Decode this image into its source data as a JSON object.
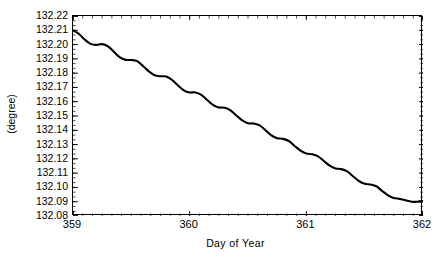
{
  "figure": {
    "title_remnant": "",
    "background_color": "#ffffff",
    "line_color": "#000000",
    "axis_color": "#000000"
  },
  "chart_data": {
    "type": "line",
    "title": "",
    "xlabel": "Day of Year",
    "ylabel": "(degree)",
    "xlim": [
      359,
      362
    ],
    "ylim": [
      132.08,
      132.22
    ],
    "grid": false,
    "legend": null,
    "xticks": [
      359,
      360,
      361,
      362
    ],
    "xtick_labels": [
      "359",
      "360",
      "361",
      "362"
    ],
    "yticks": [
      132.08,
      132.09,
      132.1,
      132.11,
      132.12,
      132.13,
      132.14,
      132.15,
      132.16,
      132.17,
      132.18,
      132.19,
      132.2,
      132.21,
      132.22
    ],
    "ytick_labels": [
      "132.22",
      "132.21",
      "132.20",
      "132.19",
      "132.18",
      "132.17",
      "132.16",
      "132.15",
      "132.14",
      "132.13",
      "132.12",
      "132.11",
      "132.10",
      "132.09",
      "132.08"
    ],
    "x_minor_tick_count": 12,
    "y_minor_tick_count": 2,
    "series": [
      {
        "name": "degree",
        "description": "Linearly decreasing trend from 132.210 to 132.090 with a superimposed ~0.25 day (6 hour) period oscillation of about 0.004 degree amplitude",
        "trend_start": 132.21,
        "trend_end": 132.0905,
        "oscillation_period_days": 0.25,
        "oscillation_amplitude": 0.0042,
        "x": [
          359.0,
          359.05,
          359.1,
          359.15,
          359.2,
          359.25,
          359.3,
          359.35,
          359.4,
          359.45,
          359.5,
          359.55,
          359.6,
          359.65,
          359.7,
          359.75,
          359.8,
          359.85,
          359.9,
          359.95,
          360.0,
          360.05,
          360.1,
          360.15,
          360.2,
          360.25,
          360.3,
          360.35,
          360.4,
          360.45,
          360.5,
          360.55,
          360.6,
          360.65,
          360.7,
          360.75,
          360.8,
          360.85,
          360.9,
          360.95,
          361.0,
          361.05,
          361.1,
          361.15,
          361.2,
          361.25,
          361.3,
          361.35,
          361.4,
          361.45,
          361.5,
          361.55,
          361.6,
          361.65,
          361.7,
          361.75,
          361.8,
          361.85,
          361.9,
          361.95,
          362.0
        ],
        "y": [
          132.21,
          132.2075,
          132.2035,
          132.2005,
          132.1998,
          132.2003,
          132.1988,
          132.195,
          132.1912,
          132.1893,
          132.1892,
          132.1884,
          132.185,
          132.1812,
          132.1785,
          132.1778,
          132.1777,
          132.1752,
          132.1714,
          132.168,
          132.1665,
          132.1665,
          132.1648,
          132.1612,
          132.1578,
          132.156,
          132.1558,
          132.154,
          132.1504,
          132.147,
          132.145,
          132.1447,
          132.1435,
          132.14,
          132.1365,
          132.1345,
          132.134,
          132.1325,
          132.129,
          132.1258,
          132.1237,
          132.1232,
          132.1218,
          132.1185,
          132.1152,
          132.1133,
          132.1128,
          132.1112,
          132.1078,
          132.1045,
          132.1025,
          132.102,
          132.1008,
          132.0975,
          132.0945,
          132.0926,
          132.092,
          132.091,
          132.09,
          132.09,
          132.0905
        ]
      }
    ]
  }
}
